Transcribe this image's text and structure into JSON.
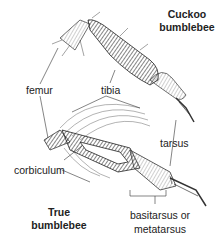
{
  "diagram": {
    "titles": {
      "cuckoo_line1": "Cuckoo",
      "cuckoo_line2": "bumblebee",
      "true_line1": "True",
      "true_line2": "bumblebee"
    },
    "labels": {
      "femur": "femur",
      "tibia": "tibia",
      "tarsus": "tarsus",
      "corbiculum": "corbiculum",
      "basitarsus_line1": "basitarsus or",
      "basitarsus_line2": "metatarsus"
    },
    "colors": {
      "ink": "#222222",
      "background": "#ffffff"
    }
  }
}
